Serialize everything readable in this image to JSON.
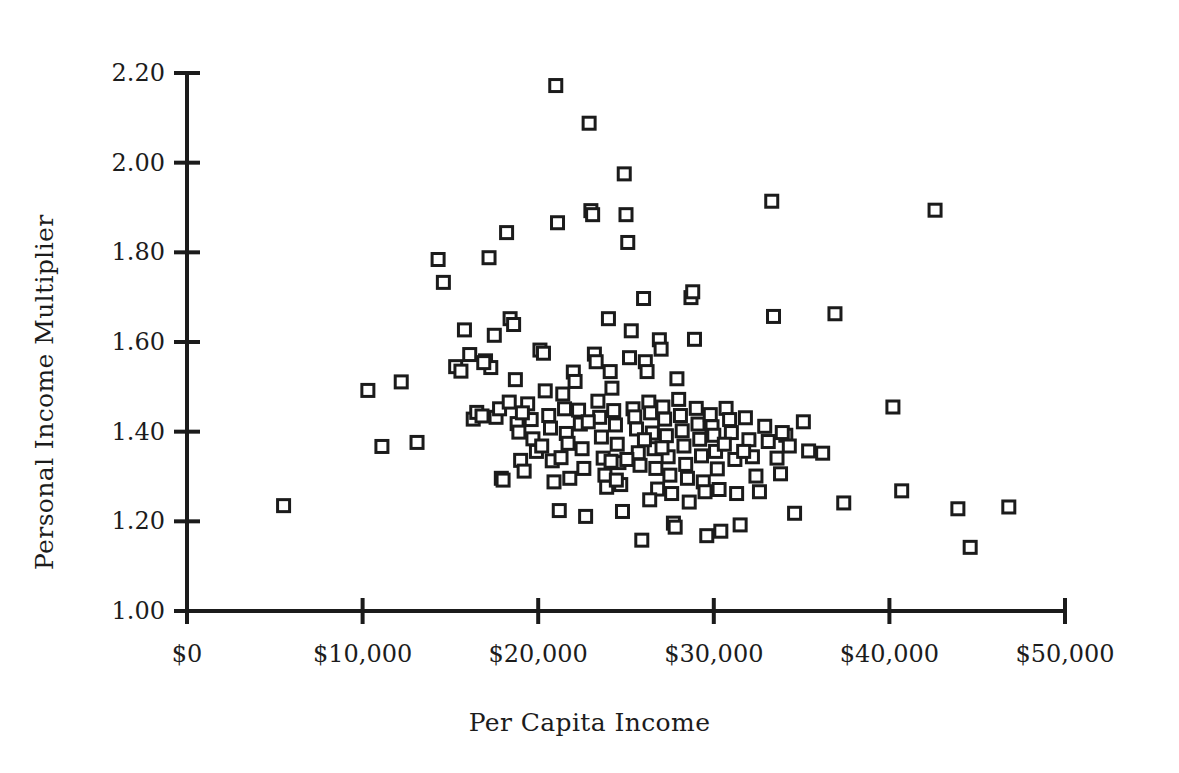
{
  "chart_data": {
    "type": "scatter",
    "title": "",
    "xlabel": "Per Capita Income",
    "ylabel": "Personal Income Multiplier",
    "xlim": [
      0,
      50000
    ],
    "ylim": [
      1.0,
      2.2
    ],
    "grid": false,
    "legend": null,
    "marker": {
      "shape": "open-square",
      "size_px": 12,
      "stroke": "#1b1b1b",
      "stroke_width": 3,
      "fill": "#ffffff"
    },
    "x_ticks": [
      0,
      10000,
      20000,
      30000,
      40000,
      50000
    ],
    "x_tick_labels": [
      "$0",
      "$10,000",
      "$20,000",
      "$30,000",
      "$40,000",
      "$50,000"
    ],
    "y_ticks": [
      1.0,
      1.2,
      1.4,
      1.6,
      1.8,
      2.0,
      2.2
    ],
    "y_tick_labels": [
      "1.00",
      "1.20",
      "1.40",
      "1.60",
      "1.80",
      "2.00",
      "2.20"
    ],
    "series": [
      {
        "name": "counties",
        "points": [
          [
            5500,
            1.235
          ],
          [
            10300,
            1.492
          ],
          [
            11100,
            1.367
          ],
          [
            12200,
            1.511
          ],
          [
            13100,
            1.376
          ],
          [
            14300,
            1.784
          ],
          [
            14600,
            1.733
          ],
          [
            15300,
            1.545
          ],
          [
            15600,
            1.535
          ],
          [
            15800,
            1.627
          ],
          [
            16100,
            1.572
          ],
          [
            16300,
            1.428
          ],
          [
            16500,
            1.443
          ],
          [
            16800,
            1.435
          ],
          [
            17000,
            1.558
          ],
          [
            17200,
            1.788
          ],
          [
            17300,
            1.543
          ],
          [
            17500,
            1.615
          ],
          [
            17600,
            1.432
          ],
          [
            17800,
            1.451
          ],
          [
            17900,
            1.296
          ],
          [
            18000,
            1.292
          ],
          [
            18200,
            1.844
          ],
          [
            18400,
            1.652
          ],
          [
            18600,
            1.639
          ],
          [
            18700,
            1.516
          ],
          [
            18800,
            1.418
          ],
          [
            18900,
            1.399
          ],
          [
            19000,
            1.336
          ],
          [
            19200,
            1.312
          ],
          [
            19400,
            1.462
          ],
          [
            19600,
            1.427
          ],
          [
            19700,
            1.384
          ],
          [
            19900,
            1.356
          ],
          [
            20100,
            1.582
          ],
          [
            20300,
            1.575
          ],
          [
            20400,
            1.491
          ],
          [
            20600,
            1.436
          ],
          [
            20700,
            1.408
          ],
          [
            20800,
            1.335
          ],
          [
            20900,
            1.288
          ],
          [
            21000,
            2.172
          ],
          [
            21100,
            1.866
          ],
          [
            21200,
            1.224
          ],
          [
            21400,
            1.484
          ],
          [
            21500,
            1.451
          ],
          [
            21600,
            1.396
          ],
          [
            21700,
            1.374
          ],
          [
            21800,
            1.296
          ],
          [
            22000,
            1.533
          ],
          [
            22100,
            1.512
          ],
          [
            22300,
            1.448
          ],
          [
            22400,
            1.417
          ],
          [
            22500,
            1.362
          ],
          [
            22600,
            1.318
          ],
          [
            22700,
            1.211
          ],
          [
            22900,
            2.088
          ],
          [
            23000,
            1.893
          ],
          [
            23100,
            1.884
          ],
          [
            23200,
            1.573
          ],
          [
            23300,
            1.556
          ],
          [
            23400,
            1.468
          ],
          [
            23500,
            1.432
          ],
          [
            23600,
            1.388
          ],
          [
            23700,
            1.341
          ],
          [
            23800,
            1.303
          ],
          [
            24000,
            1.652
          ],
          [
            24100,
            1.534
          ],
          [
            24200,
            1.497
          ],
          [
            24300,
            1.447
          ],
          [
            24400,
            1.415
          ],
          [
            24500,
            1.372
          ],
          [
            24600,
            1.331
          ],
          [
            24700,
            1.282
          ],
          [
            24800,
            1.222
          ],
          [
            24900,
            1.975
          ],
          [
            25000,
            1.884
          ],
          [
            25100,
            1.822
          ],
          [
            25200,
            1.565
          ],
          [
            25300,
            1.625
          ],
          [
            25400,
            1.451
          ],
          [
            25500,
            1.433
          ],
          [
            25600,
            1.406
          ],
          [
            25700,
            1.353
          ],
          [
            25800,
            1.325
          ],
          [
            25900,
            1.158
          ],
          [
            26000,
            1.697
          ],
          [
            26100,
            1.556
          ],
          [
            26200,
            1.534
          ],
          [
            26300,
            1.466
          ],
          [
            26400,
            1.442
          ],
          [
            26500,
            1.397
          ],
          [
            26600,
            1.362
          ],
          [
            26700,
            1.318
          ],
          [
            26800,
            1.272
          ],
          [
            26900,
            1.605
          ],
          [
            27000,
            1.584
          ],
          [
            27100,
            1.455
          ],
          [
            27200,
            1.428
          ],
          [
            27300,
            1.391
          ],
          [
            27400,
            1.344
          ],
          [
            27500,
            1.303
          ],
          [
            27600,
            1.262
          ],
          [
            27700,
            1.196
          ],
          [
            27800,
            1.187
          ],
          [
            27900,
            1.518
          ],
          [
            28000,
            1.472
          ],
          [
            28100,
            1.436
          ],
          [
            28200,
            1.402
          ],
          [
            28300,
            1.368
          ],
          [
            28400,
            1.327
          ],
          [
            28500,
            1.296
          ],
          [
            28600,
            1.243
          ],
          [
            28700,
            1.699
          ],
          [
            28800,
            1.712
          ],
          [
            28900,
            1.606
          ],
          [
            29000,
            1.452
          ],
          [
            29100,
            1.417
          ],
          [
            29200,
            1.383
          ],
          [
            29300,
            1.346
          ],
          [
            29400,
            1.288
          ],
          [
            29500,
            1.266
          ],
          [
            29600,
            1.168
          ],
          [
            29800,
            1.438
          ],
          [
            29900,
            1.411
          ],
          [
            30000,
            1.392
          ],
          [
            30100,
            1.356
          ],
          [
            30200,
            1.317
          ],
          [
            30300,
            1.271
          ],
          [
            30400,
            1.178
          ],
          [
            30700,
            1.452
          ],
          [
            30900,
            1.427
          ],
          [
            31000,
            1.398
          ],
          [
            31200,
            1.338
          ],
          [
            31300,
            1.262
          ],
          [
            31500,
            1.192
          ],
          [
            31800,
            1.431
          ],
          [
            32000,
            1.382
          ],
          [
            32200,
            1.344
          ],
          [
            32400,
            1.301
          ],
          [
            32600,
            1.266
          ],
          [
            32900,
            1.412
          ],
          [
            33100,
            1.378
          ],
          [
            33300,
            1.914
          ],
          [
            33400,
            1.657
          ],
          [
            33600,
            1.341
          ],
          [
            33800,
            1.306
          ],
          [
            34100,
            1.392
          ],
          [
            34300,
            1.368
          ],
          [
            34600,
            1.218
          ],
          [
            35100,
            1.422
          ],
          [
            35400,
            1.357
          ],
          [
            36200,
            1.352
          ],
          [
            36900,
            1.663
          ],
          [
            37400,
            1.241
          ],
          [
            40200,
            1.455
          ],
          [
            40700,
            1.268
          ],
          [
            42600,
            1.894
          ],
          [
            43900,
            1.228
          ],
          [
            44600,
            1.142
          ],
          [
            46800,
            1.232
          ],
          [
            16900,
            1.554
          ],
          [
            19100,
            1.442
          ],
          [
            20200,
            1.368
          ],
          [
            21300,
            1.342
          ],
          [
            23900,
            1.276
          ],
          [
            25050,
            1.338
          ],
          [
            26050,
            1.382
          ],
          [
            27050,
            1.364
          ],
          [
            24450,
            1.292
          ],
          [
            22850,
            1.422
          ],
          [
            18350,
            1.466
          ],
          [
            30600,
            1.372
          ],
          [
            31700,
            1.356
          ],
          [
            33900,
            1.398
          ],
          [
            26350,
            1.248
          ],
          [
            24150,
            1.334
          ]
        ]
      }
    ]
  },
  "axes": {
    "y_title": "Personal Income Multiplier",
    "x_title": "Per Capita Income"
  }
}
